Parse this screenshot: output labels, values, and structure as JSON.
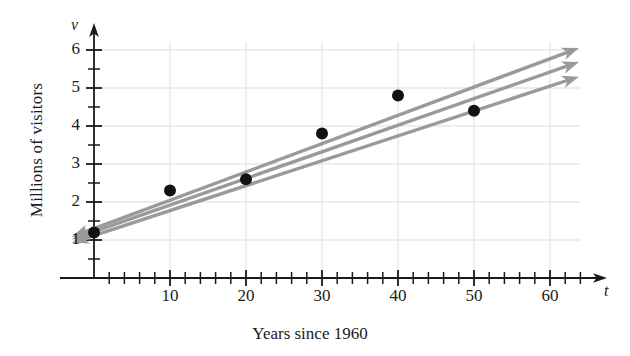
{
  "chart_data": {
    "type": "scatter",
    "title": "",
    "xlabel": "Years since 1960",
    "ylabel": "Millions of visitors",
    "x_axis_variable": "t",
    "y_axis_variable": "v",
    "xlim": [
      0,
      65
    ],
    "ylim": [
      0,
      6.6
    ],
    "x_major_ticks": [
      0,
      10,
      20,
      30,
      40,
      50,
      60
    ],
    "x_tick_labels": [
      "",
      "10",
      "20",
      "30",
      "40",
      "50",
      "60"
    ],
    "x_minor_tick_step": 2,
    "y_major_ticks": [
      1,
      2,
      3,
      4,
      5,
      6
    ],
    "y_tick_labels": [
      "1",
      "2",
      "3",
      "4",
      "5",
      "6"
    ],
    "y_minor_tick_step": 0.5,
    "grid": true,
    "grid_x": [
      10,
      20,
      30,
      40,
      50,
      60
    ],
    "grid_y": [
      1,
      2,
      3,
      4,
      5,
      6
    ],
    "legend": "none",
    "points": [
      {
        "x": 0,
        "y": 1.2
      },
      {
        "x": 10,
        "y": 2.3
      },
      {
        "x": 20,
        "y": 2.6
      },
      {
        "x": 30,
        "y": 3.8
      },
      {
        "x": 40,
        "y": 4.8
      },
      {
        "x": 50,
        "y": 4.4
      }
    ],
    "point_color": "#111111",
    "point_radius": 6,
    "line_color": "#9a9a9a",
    "series": [
      {
        "name": "trend-line-upper",
        "intercept": 1.3,
        "slope": 0.0745,
        "x_start": -2.9,
        "x_end": 63.8,
        "arrow_start": true,
        "arrow_end": true
      },
      {
        "name": "trend-line-middle",
        "intercept": 1.22,
        "slope": 0.07,
        "x_start": -2.9,
        "x_end": 63.8,
        "arrow_start": true,
        "arrow_end": true
      },
      {
        "name": "trend-line-lower",
        "intercept": 1.12,
        "slope": 0.0655,
        "x_start": -2.9,
        "x_end": 63.8,
        "arrow_start": true,
        "arrow_end": true
      }
    ]
  },
  "labels": {
    "y_axis_title": "Millions of visitors",
    "x_axis_title": "Years since 1960",
    "y_axis_variable": "v",
    "x_axis_variable": "t",
    "y_ticks": [
      "6",
      "5",
      "4",
      "3",
      "2",
      "1"
    ],
    "x_ticks": [
      "10",
      "20",
      "30",
      "40",
      "50",
      "60"
    ]
  },
  "colors": {
    "axis": "#1a1a1a",
    "grid": "#dcdcdc",
    "line": "#9a9a9a",
    "point": "#111111",
    "background": "#ffffff"
  }
}
